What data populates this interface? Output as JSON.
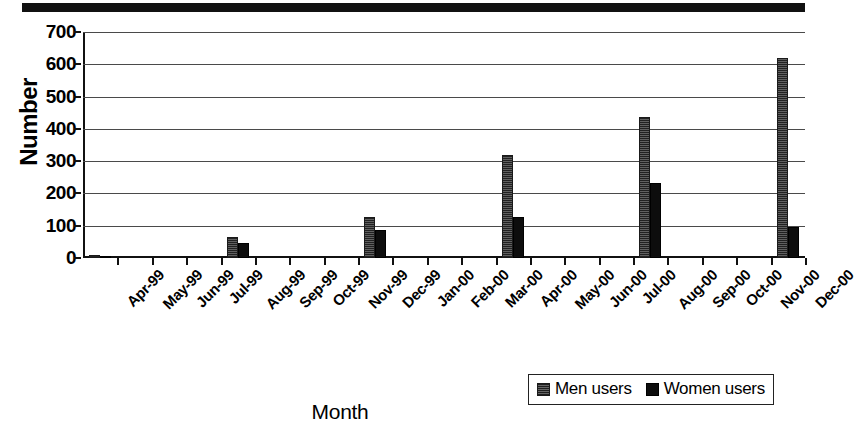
{
  "chart_data": {
    "type": "bar",
    "title": "",
    "xlabel": "Month",
    "ylabel": "Number",
    "ylim": [
      0,
      700
    ],
    "yticks": [
      0,
      100,
      200,
      300,
      400,
      500,
      600,
      700
    ],
    "grid": true,
    "legend_position": "bottom-right",
    "categories": [
      "Apr-99",
      "May-99",
      "Jun-99",
      "Jul-99",
      "Aug-99",
      "Sep-99",
      "Oct-99",
      "Nov-99",
      "Dec-99",
      "Jan-00",
      "Feb-00",
      "Mar-00",
      "Apr-00",
      "May-00",
      "Jun-00",
      "Jul-00",
      "Aug-00",
      "Sep-00",
      "Oct-00",
      "Nov-00",
      "Dec-00"
    ],
    "series": [
      {
        "name": "Men users",
        "color": "#4a4a4a",
        "values": [
          8,
          0,
          0,
          0,
          65,
          0,
          0,
          0,
          128,
          0,
          0,
          0,
          318,
          0,
          0,
          0,
          438,
          0,
          0,
          0,
          620
        ]
      },
      {
        "name": "Women users",
        "color": "#0d0d0d",
        "values": [
          4,
          0,
          0,
          0,
          45,
          0,
          0,
          0,
          88,
          0,
          0,
          0,
          128,
          0,
          0,
          0,
          233,
          0,
          0,
          0,
          95
        ]
      }
    ]
  },
  "legend": {
    "entries": [
      {
        "label": "Men users"
      },
      {
        "label": "Women users"
      }
    ]
  }
}
